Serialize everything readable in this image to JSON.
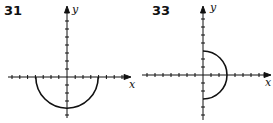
{
  "figures": [
    {
      "number": "31",
      "x_label": "x",
      "y_label": "y",
      "curve": "lower semicircle centered at origin, radius 4",
      "origin": [
        67,
        77
      ],
      "tick_px": 7.8,
      "radius_units": 4
    },
    {
      "number": "33",
      "x_label": "x",
      "y_label": "y",
      "curve": "right semicircle centered at origin, radius 3",
      "origin": [
        203,
        75
      ],
      "tick_px": 8,
      "radius_units": 3
    }
  ]
}
